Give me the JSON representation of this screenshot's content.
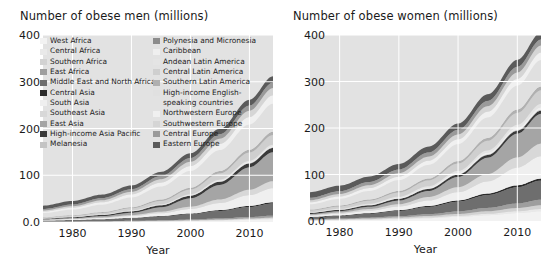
{
  "panels": [
    {
      "id": "men",
      "title": "Number of obese men (millions)",
      "xlabel": "Year"
    },
    {
      "id": "women",
      "title": "Number of obese women (millions)",
      "xlabel": "Year"
    }
  ],
  "axes": {
    "yticks": [
      "400",
      "300",
      "200",
      "100",
      "0.0"
    ],
    "ytick_values": [
      400,
      300,
      200,
      100,
      0
    ],
    "xticks": [
      "1980",
      "1990",
      "2000",
      "2010"
    ],
    "xtick_values": [
      1980,
      1990,
      2000,
      2010
    ],
    "ylim": [
      0,
      400
    ],
    "xlim": [
      1975,
      2014
    ],
    "grid": "white gridlines on light gray plot background",
    "plot_background": "#e2e2e2",
    "gridline_color": "#ffffff"
  },
  "legend": {
    "position": "overlay upper-left of men panel, two columns",
    "columns": [
      {
        "items": [
          {
            "label": "West Africa",
            "color": "#f2f2f2"
          },
          {
            "label": "Central Africa",
            "color": "#e9e9e9"
          },
          {
            "label": "Southern Africa",
            "color": "#d2d2d2"
          },
          {
            "label": "East Africa",
            "color": "#9e9e9e"
          },
          {
            "label": "Middle East and North Africa",
            "color": "#6e6e6e"
          },
          {
            "label": "Central Asia",
            "color": "#2b2b2b"
          },
          {
            "label": "South Asia",
            "color": "#efefef"
          },
          {
            "label": "Southeast Asia",
            "color": "#d8d8d8"
          },
          {
            "label": "East Asia",
            "color": "#a5a5a5"
          },
          {
            "label": "High-income Asia Pacific",
            "color": "#3a3a3a"
          },
          {
            "label": "Melanesia",
            "color": "#c4c4c4"
          }
        ]
      },
      {
        "items": [
          {
            "label": "Polynesia and Micronesia",
            "color": "#8c8c8c"
          },
          {
            "label": "Caribbean",
            "color": "#efefef"
          },
          {
            "label": "Andean Latin America",
            "color": "#e4e4e4"
          },
          {
            "label": "Central Latin America",
            "color": "#cfcfcf"
          },
          {
            "label": "Southern Latin America",
            "color": "#b0b0b0"
          },
          {
            "label": "High-income English-",
            "color": "#e0e0e0"
          },
          {
            "label": "speaking countries",
            "color": null
          },
          {
            "label": "Northwestern Europe",
            "color": "#f0f0f0"
          },
          {
            "label": "Southwestern Europe",
            "color": "#d5d5d5"
          },
          {
            "label": "Central Europe",
            "color": "#9a9a9a"
          },
          {
            "label": "Eastern Europe",
            "color": "#5a5a5a"
          }
        ]
      }
    ]
  },
  "chart_data": [
    {
      "type": "area",
      "stacked": true,
      "id": "men",
      "title": "Number of obese men (millions)",
      "xlabel": "Year",
      "ylabel": "Number of obese men (millions)",
      "xlim": [
        1975,
        2014
      ],
      "ylim": [
        0,
        400
      ],
      "x": [
        1975,
        1980,
        1985,
        1990,
        1995,
        2000,
        2005,
        2010,
        2014
      ],
      "total": [
        35,
        45,
        58,
        75,
        100,
        133,
        176,
        228,
        275
      ],
      "series": [
        {
          "name": "West Africa",
          "color": "#f2f2f2",
          "values": [
            0.3,
            0.4,
            0.6,
            0.9,
            1.3,
            2.0,
            3.0,
            4.4,
            5.8
          ]
        },
        {
          "name": "Central Africa",
          "color": "#e9e9e9",
          "values": [
            0.1,
            0.15,
            0.2,
            0.3,
            0.45,
            0.65,
            0.95,
            1.3,
            1.6
          ]
        },
        {
          "name": "Southern Africa",
          "color": "#d2d2d2",
          "values": [
            0.2,
            0.25,
            0.35,
            0.5,
            0.7,
            0.95,
            1.3,
            1.7,
            2.1
          ]
        },
        {
          "name": "East Africa",
          "color": "#9e9e9e",
          "values": [
            0.3,
            0.4,
            0.55,
            0.8,
            1.1,
            1.6,
            2.3,
            3.2,
            4.1
          ]
        },
        {
          "name": "Middle East and North Africa",
          "color": "#6e6e6e",
          "values": [
            1.6,
            2.4,
            3.6,
            5.4,
            8.0,
            11.5,
            16.0,
            21.5,
            26.0
          ]
        },
        {
          "name": "Central Asia",
          "color": "#2b2b2b",
          "values": [
            0.5,
            0.6,
            0.75,
            0.95,
            1.2,
            1.5,
            1.9,
            2.4,
            2.8
          ]
        },
        {
          "name": "South Asia",
          "color": "#efefef",
          "values": [
            1.2,
            1.7,
            2.5,
            3.8,
            6.0,
            9.5,
            15.0,
            23.0,
            30.0
          ]
        },
        {
          "name": "Southeast Asia",
          "color": "#d8d8d8",
          "values": [
            0.6,
            0.9,
            1.3,
            2.0,
            3.2,
            5.0,
            7.8,
            11.5,
            15.0
          ]
        },
        {
          "name": "East Asia",
          "color": "#a5a5a5",
          "values": [
            1.0,
            1.6,
            2.8,
            5.0,
            9.5,
            18.0,
            31.0,
            48.0,
            62.0
          ]
        },
        {
          "name": "High-income Asia Pacific",
          "color": "#3a3a3a",
          "values": [
            1.3,
            1.8,
            2.4,
            3.2,
            4.2,
            5.4,
            6.8,
            8.2,
            9.2
          ]
        },
        {
          "name": "Melanesia",
          "color": "#c4c4c4",
          "values": [
            0.05,
            0.07,
            0.1,
            0.14,
            0.2,
            0.28,
            0.38,
            0.5,
            0.6
          ]
        },
        {
          "name": "Polynesia and Micronesia",
          "color": "#8c8c8c",
          "values": [
            0.05,
            0.07,
            0.1,
            0.13,
            0.18,
            0.24,
            0.31,
            0.4,
            0.47
          ]
        },
        {
          "name": "Caribbean",
          "color": "#efefef",
          "values": [
            0.3,
            0.4,
            0.55,
            0.75,
            1.0,
            1.35,
            1.8,
            2.3,
            2.7
          ]
        },
        {
          "name": "Andean Latin America",
          "color": "#e4e4e4",
          "values": [
            0.2,
            0.3,
            0.45,
            0.65,
            0.95,
            1.35,
            1.9,
            2.5,
            3.1
          ]
        },
        {
          "name": "Central Latin America",
          "color": "#cfcfcf",
          "values": [
            1.5,
            2.2,
            3.2,
            4.8,
            7.0,
            10.0,
            13.5,
            17.5,
            20.5
          ]
        },
        {
          "name": "Southern Latin America",
          "color": "#b0b0b0",
          "values": [
            1.0,
            1.3,
            1.7,
            2.3,
            3.0,
            3.9,
            5.0,
            6.2,
            7.1
          ]
        },
        {
          "name": "High-income English-speaking countries",
          "color": "#e0e0e0",
          "values": [
            9.0,
            12.0,
            16.0,
            21.0,
            28.0,
            36.0,
            45.0,
            54.0,
            60.0
          ]
        },
        {
          "name": "Northwestern Europe",
          "color": "#f0f0f0",
          "values": [
            3.0,
            3.9,
            5.0,
            6.4,
            8.2,
            10.4,
            13.0,
            15.8,
            18.0
          ]
        },
        {
          "name": "Southwestern Europe",
          "color": "#d5d5d5",
          "values": [
            2.5,
            3.3,
            4.3,
            5.6,
            7.2,
            9.1,
            11.3,
            13.6,
            15.4
          ]
        },
        {
          "name": "Central Europe",
          "color": "#9a9a9a",
          "values": [
            3.0,
            3.7,
            4.6,
            5.6,
            6.8,
            8.1,
            9.5,
            10.9,
            11.9
          ]
        },
        {
          "name": "Eastern Europe",
          "color": "#5a5a5a",
          "values": [
            7.3,
            7.6,
            7.5,
            8.0,
            9.0,
            10.2,
            11.5,
            12.6,
            13.5
          ]
        }
      ]
    },
    {
      "type": "area",
      "stacked": true,
      "id": "women",
      "title": "Number of obese women (millions)",
      "xlabel": "Year",
      "ylabel": "Number of obese women (millions)",
      "xlim": [
        1975,
        2014
      ],
      "ylim": [
        0,
        400
      ],
      "x": [
        1975,
        1980,
        1985,
        1990,
        1995,
        2000,
        2005,
        2010,
        2014
      ],
      "total": [
        62,
        76,
        95,
        120,
        152,
        194,
        245,
        300,
        340
      ],
      "series": [
        {
          "name": "West Africa",
          "color": "#f2f2f2",
          "values": [
            1.2,
            1.8,
            2.7,
            4.0,
            6.0,
            8.8,
            12.5,
            17.0,
            21.0
          ]
        },
        {
          "name": "Central Africa",
          "color": "#e9e9e9",
          "values": [
            0.4,
            0.55,
            0.75,
            1.05,
            1.5,
            2.1,
            2.9,
            3.9,
            4.8
          ]
        },
        {
          "name": "Southern Africa",
          "color": "#d2d2d2",
          "values": [
            1.1,
            1.4,
            1.9,
            2.5,
            3.3,
            4.3,
            5.5,
            6.9,
            8.0
          ]
        },
        {
          "name": "East Africa",
          "color": "#9e9e9e",
          "values": [
            1.0,
            1.4,
            1.9,
            2.7,
            3.8,
            5.3,
            7.3,
            9.8,
            12.0
          ]
        },
        {
          "name": "Middle East and North Africa",
          "color": "#6e6e6e",
          "values": [
            4.0,
            5.6,
            8.0,
            11.2,
            15.5,
            21.0,
            27.5,
            35.0,
            41.0
          ]
        },
        {
          "name": "Central Asia",
          "color": "#2b2b2b",
          "values": [
            1.1,
            1.3,
            1.6,
            1.9,
            2.3,
            2.8,
            3.4,
            4.1,
            4.6
          ]
        },
        {
          "name": "South Asia",
          "color": "#efefef",
          "values": [
            2.6,
            3.6,
            5.2,
            7.6,
            11.5,
            17.5,
            26.0,
            38.0,
            48.0
          ]
        },
        {
          "name": "Southeast Asia",
          "color": "#d8d8d8",
          "values": [
            1.8,
            2.5,
            3.6,
            5.2,
            7.6,
            11.0,
            16.0,
            22.0,
            27.0
          ]
        },
        {
          "name": "East Asia",
          "color": "#a5a5a5",
          "values": [
            2.0,
            3.0,
            4.8,
            7.8,
            13.0,
            22.0,
            35.0,
            51.0,
            64.0
          ]
        },
        {
          "name": "High-income Asia Pacific",
          "color": "#3a3a3a",
          "values": [
            2.3,
            2.8,
            3.3,
            3.9,
            4.5,
            5.1,
            5.8,
            6.4,
            6.9
          ]
        },
        {
          "name": "Melanesia",
          "color": "#c4c4c4",
          "values": [
            0.1,
            0.14,
            0.19,
            0.26,
            0.35,
            0.47,
            0.62,
            0.8,
            0.95
          ]
        },
        {
          "name": "Polynesia and Micronesia",
          "color": "#8c8c8c",
          "values": [
            0.1,
            0.13,
            0.17,
            0.22,
            0.29,
            0.37,
            0.47,
            0.58,
            0.67
          ]
        },
        {
          "name": "Caribbean",
          "color": "#efefef",
          "values": [
            0.8,
            1.05,
            1.4,
            1.85,
            2.4,
            3.1,
            3.9,
            4.8,
            5.5
          ]
        },
        {
          "name": "Andean Latin America",
          "color": "#e4e4e4",
          "values": [
            0.7,
            1.0,
            1.4,
            2.0,
            2.8,
            3.8,
            5.0,
            6.4,
            7.5
          ]
        },
        {
          "name": "Central Latin America",
          "color": "#cfcfcf",
          "values": [
            3.5,
            4.8,
            6.6,
            9.0,
            12.2,
            16.0,
            20.5,
            25.5,
            29.0
          ]
        },
        {
          "name": "Southern Latin America",
          "color": "#b0b0b0",
          "values": [
            1.8,
            2.2,
            2.7,
            3.4,
            4.2,
            5.2,
            6.3,
            7.5,
            8.4
          ]
        },
        {
          "name": "High-income English-speaking countries",
          "color": "#e0e0e0",
          "values": [
            11.5,
            14.5,
            18.5,
            23.5,
            29.5,
            36.5,
            44.0,
            51.5,
            57.0
          ]
        },
        {
          "name": "Northwestern Europe",
          "color": "#f0f0f0",
          "values": [
            4.2,
            5.0,
            6.0,
            7.2,
            8.7,
            10.4,
            12.3,
            14.3,
            15.8
          ]
        },
        {
          "name": "Southwestern Europe",
          "color": "#d5d5d5",
          "values": [
            4.5,
            5.3,
            6.3,
            7.5,
            8.9,
            10.4,
            12.1,
            13.8,
            15.1
          ]
        },
        {
          "name": "Central Europe",
          "color": "#9a9a9a",
          "values": [
            5.2,
            6.0,
            6.9,
            7.9,
            8.9,
            10.0,
            11.1,
            12.1,
            12.9
          ]
        },
        {
          "name": "Eastern Europe",
          "color": "#5a5a5a",
          "values": [
            12.1,
            12.0,
            11.6,
            11.9,
            12.6,
            13.4,
            14.3,
            15.1,
            15.7
          ]
        }
      ]
    }
  ]
}
